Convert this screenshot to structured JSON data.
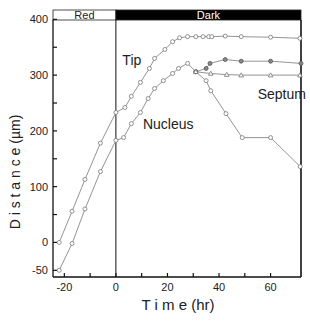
{
  "chart_data": {
    "type": "line",
    "title": "",
    "xlabel": "T i m e (hr)",
    "ylabel": "D i s t a n c e (µm)",
    "xlim": [
      -24.4,
      71.8
    ],
    "ylim": [
      -62,
      415
    ],
    "xticks": [
      -20,
      0,
      20,
      40,
      60
    ],
    "xminor": [
      -10,
      10,
      30,
      50
    ],
    "yticks": [
      -50,
      0,
      100,
      200,
      300,
      400
    ],
    "ytick_labels": [
      "-50",
      "0",
      "100",
      "200",
      "300",
      "400"
    ],
    "yminor": [
      50,
      150,
      250,
      350
    ],
    "grid": false,
    "vline_x": 0,
    "phase_bar": [
      {
        "label": "Red",
        "from": -24.4,
        "to": 0,
        "fill": "#ffffff",
        "text_color": "#222222"
      },
      {
        "label": "Dark",
        "from": 0,
        "to": 71.8,
        "fill": "#000000",
        "text_color": "#ffffff"
      }
    ],
    "series": [
      {
        "name": "Tip",
        "marker": "circle-open",
        "x": [
          -22,
          -17,
          -12,
          -6,
          0,
          3.5,
          6,
          9.5,
          13,
          15,
          19,
          22,
          24.7,
          27.8,
          31,
          33.8,
          36,
          37.2,
          42.4,
          48.6,
          60,
          71.4
        ],
        "y": [
          0,
          56,
          113,
          178,
          233,
          242,
          262,
          287,
          312,
          330,
          346,
          360,
          367,
          369,
          369,
          369,
          369,
          369,
          370,
          369,
          368,
          366
        ]
      },
      {
        "name": "Nucleus",
        "marker": "circle-open",
        "x": [
          -22,
          -17,
          -12,
          -6,
          0,
          3,
          6,
          9.5,
          12.5,
          15,
          18.4,
          22,
          24.3,
          27.8,
          31,
          35,
          36.8,
          42.7,
          49,
          60,
          71.5
        ],
        "y": [
          -50,
          -2,
          60,
          127,
          183,
          188,
          213,
          233,
          258,
          276,
          290,
          303,
          312,
          321,
          306,
          290,
          272,
          231,
          188,
          188,
          136
        ]
      },
      {
        "name": "Septum (filled)",
        "marker": "circle-filled",
        "x": [
          31,
          35,
          36.5,
          42.4,
          48.6,
          60,
          71.8
        ],
        "y": [
          306,
          312,
          321,
          328,
          325,
          325,
          321
        ]
      },
      {
        "name": "Septum",
        "marker": "triangle-open",
        "x": [
          31,
          36.8,
          43,
          48.6,
          60,
          71.4
        ],
        "y": [
          306,
          303,
          301,
          300,
          300,
          300
        ]
      }
    ],
    "annotations": [
      {
        "text": "Tip",
        "x": 2.5,
        "y": 318
      },
      {
        "text": "Nucleus",
        "x": 10.5,
        "y": 203
      },
      {
        "text": "Septum",
        "x": 55,
        "y": 258
      }
    ]
  }
}
